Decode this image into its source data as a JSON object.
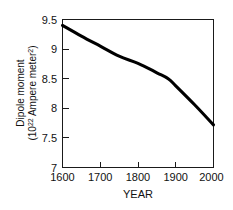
{
  "chart_data": {
    "type": "line",
    "title": "",
    "xlabel": "YEAR",
    "ylabel_line1": "Dipole moment",
    "ylabel_line2_prefix": "(10",
    "ylabel_line2_exp": "22",
    "ylabel_line2_mid": " Ampere meter",
    "ylabel_line2_exp2": "2",
    "ylabel_line2_suffix": ")",
    "ylabel_full": "Dipole moment (10^22 Ampere meter^2)",
    "xlim": [
      1600,
      2000
    ],
    "ylim": [
      7,
      9.5
    ],
    "xticks": [
      "1600",
      "1700",
      "1800",
      "1900",
      "2000"
    ],
    "xtick_values": [
      1600,
      1700,
      1800,
      1900,
      2000
    ],
    "yticks": [
      "9.5",
      "9",
      "8.5",
      "8",
      "7.5",
      "7"
    ],
    "ytick_values": [
      9.5,
      9,
      8.5,
      8,
      7.5,
      7
    ],
    "grid": false,
    "legend": "none",
    "series": [
      {
        "name": "Geomagnetic dipole moment",
        "color": "#000000",
        "x": [
          1600,
          1650,
          1700,
          1750,
          1800,
          1850,
          1880,
          1900,
          1950,
          2000
        ],
        "values": [
          9.4,
          9.22,
          9.05,
          8.88,
          8.76,
          8.6,
          8.5,
          8.38,
          8.06,
          7.72
        ]
      }
    ]
  }
}
